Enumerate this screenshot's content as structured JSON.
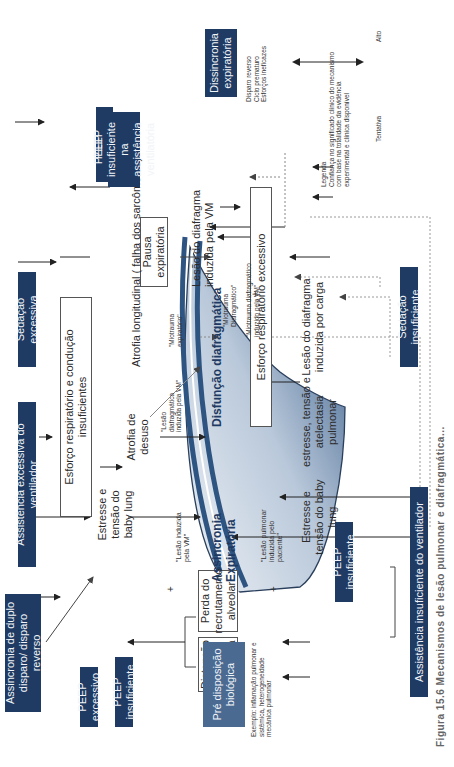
{
  "diagram": {
    "center_labels": {
      "assincronia": "Assincronia Expiratória",
      "disfuncao": "Disfunção diafragmática"
    },
    "causes_top": {
      "assincronia_duplo_disparo": "Assincronia de duplo disparo/ disparo reverso",
      "assistencia_excessiva": "Assistência excessiva do ventilador",
      "sedacao_excessiva": "Sedação excessiva",
      "peep_excessivo_top": "PEEP excessivo",
      "dissincronia_expiratoria": "Dissincronia expiratória",
      "dissincronia_items": [
        "Disparo reverso",
        "Ciclo prematuro",
        "Esforços ineficazes"
      ]
    },
    "causes_bottom": {
      "peep_excessivo": "PEEP excessivo",
      "peep_insuficiente": "PEEP insuficiente",
      "predisposicao_biologica": "Pré disposição biológica",
      "predisposicao_example": "Exemplo: inflamação pulmonar e sistêmica, heterogeneidade mecânica pulmonar",
      "peep_insuficiente_2": "PEEP insuficiente",
      "assistencia_insuficiente": "Assistência insuficiente do ventilador",
      "sedacao_insuficiente": "Sedação insuficiente",
      "peep_insuficiente_assistencia": "PEEP insuficiente na assistência ventilatória"
    },
    "mechanism_boxes": {
      "distencao_alveolar": "Distenção alveolar excessiva",
      "perda_recrutamento": "Perda do recrutamento alveolar",
      "esforco_insuficientes": "Esforço respiratório e condução insuficientes",
      "esforco_excessivo": "Esforço respiratório excessivo",
      "pausa_expiratoria": "Pausa expiratória"
    },
    "mechanism_labels": {
      "estresse_baby_lung_top": "Estresse e tensão do baby lung",
      "atrofia_desuso": "Atrofia de desuso",
      "atrofia_longitudinal": "Atrofia longitudinal ( falha dos sarcômeros)",
      "lesao_diafragma_vm": "Lesão do diafragma induzida pela VM",
      "estresse_baby_lung_bottom": "Estresse e tensão do baby lung",
      "estresse_atelectasia": "estresse, tensão e atelectasia pulmonar",
      "lesao_diafragma_carga": "Lesão do diafragma induzida por carga"
    },
    "quoted_labels": {
      "lesao_induzida_vm": "\"Lesão induzida pela VM\"",
      "lesao_pulmonar_paciente": "\"Lesão pulmonar induzida pelo paciente\"",
      "lesao_diafragmatica_vm": "\"Lesão diafragmática induzida pela VM\"",
      "miotrauma_expiratorio": "\"Miotrauma expiratório\"",
      "miotrauma_diafragmatico": "\"Miotrauma Diafragmático\"",
      "miotrauma_diafragmatico_vm": "\"Miotrauma diafragmático induzido pela VM\""
    },
    "plus_signs": [
      "+",
      "+",
      "+"
    ],
    "legend": {
      "title": "Legenda",
      "text": "Confiança no significado clínico do mecanismo com base na totalidade da evidência experimental e clínica disponível",
      "low_label": "Tentativa",
      "high_label": "Alto"
    },
    "caption": "Figura 15.6  Mecanismos de lesão pulmonar e diafragmática..."
  },
  "colors": {
    "navy": "#1f3b63",
    "lung_gradient_dark": "#2e5482",
    "lung_gradient_light": "#eef2f6",
    "line": "#333333",
    "dotted_line": "#9a9a9a"
  }
}
